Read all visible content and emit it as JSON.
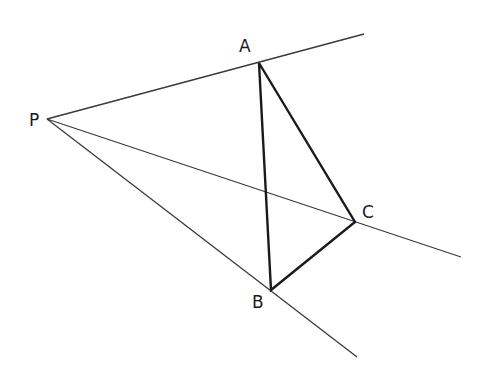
{
  "diagram": {
    "background": "#ffffff",
    "line_color": "#2a2a2a",
    "points": {
      "P": {
        "label": "P",
        "x": 47,
        "y": 119
      },
      "A": {
        "label": "A",
        "x": 259,
        "y": 63
      },
      "B": {
        "label": "B",
        "x": 271,
        "y": 290
      },
      "C": {
        "label": "C",
        "x": 355,
        "y": 222
      }
    },
    "rays": [
      {
        "name": "ray-PA",
        "from": "P",
        "to": [
          364,
          34
        ]
      },
      {
        "name": "ray-PC",
        "from": "P",
        "to": [
          461,
          257
        ]
      },
      {
        "name": "ray-PB",
        "from": "P",
        "to": [
          357,
          357
        ]
      }
    ],
    "triangle": [
      "A",
      "B",
      "C"
    ]
  }
}
